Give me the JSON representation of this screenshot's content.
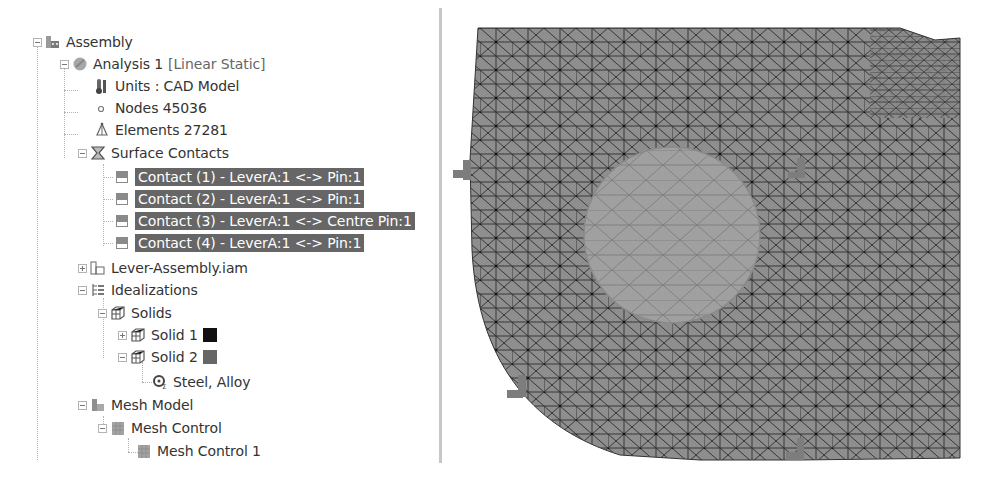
{
  "tree": {
    "root": {
      "label": "Assembly",
      "icon": "assembly-icon",
      "expanded": true
    },
    "analysis": {
      "label": "Analysis 1",
      "tag": "[Linear Static]",
      "icon": "analysis-icon",
      "expanded": true
    },
    "units": {
      "label": "Units : CAD Model",
      "icon": "units-icon"
    },
    "nodes": {
      "label": "Nodes 45036",
      "icon": "node-icon"
    },
    "elements": {
      "label": "Elements 27281",
      "icon": "element-icon"
    },
    "surface_contacts": {
      "label": "Surface Contacts",
      "icon": "surface-contacts-icon",
      "expanded": true,
      "items": [
        {
          "label": "Contact (1) - LeverA:1 <-> Pin:1",
          "selected": true
        },
        {
          "label": "Contact (2) - LeverA:1 <-> Pin:1",
          "selected": true
        },
        {
          "label": "Contact (3) - LeverA:1 <-> Centre Pin:1",
          "selected": true
        },
        {
          "label": "Contact (4) - LeverA:1 <-> Pin:1",
          "selected": true
        }
      ]
    },
    "lever_assembly": {
      "label": "Lever-Assembly.iam",
      "icon": "assembly-icon",
      "expanded": false
    },
    "idealizations": {
      "label": "Idealizations",
      "icon": "idealizations-icon",
      "expanded": true
    },
    "solids": {
      "label": "Solids",
      "icon": "solids-icon",
      "expanded": true,
      "items": [
        {
          "label": "Solid 1",
          "color": "#111111",
          "expanded": false
        },
        {
          "label": "Solid 2",
          "color": "#666666",
          "expanded": true,
          "material": "Steel, Alloy"
        }
      ]
    },
    "mesh_model": {
      "label": "Mesh Model",
      "icon": "mesh-model-icon",
      "expanded": true
    },
    "mesh_control": {
      "label": "Mesh Control",
      "icon": "mesh-control-icon",
      "expanded": true
    },
    "mesh_control_1": {
      "label": "Mesh Control 1",
      "icon": "mesh-control-icon"
    }
  },
  "viewport": {
    "description": "Tetrahedral FE mesh of lever part with contact region and pin constraints",
    "mesh_fill": "#8e8e8e",
    "mesh_line": "#2b2b2b",
    "contact_fill": "#a0a0a0"
  },
  "colors": {
    "selection_bg": "#666666",
    "selection_text": "#ffffff",
    "text": "#333333",
    "divider": "#c7c7c7"
  }
}
